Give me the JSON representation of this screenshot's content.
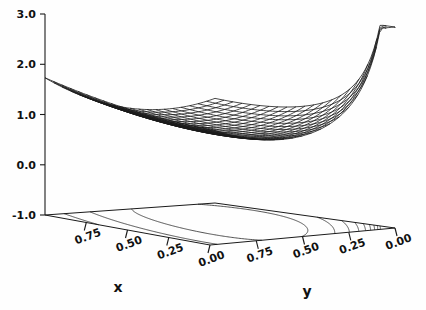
{
  "chart_data": {
    "type": "line",
    "render": "surface3d-wireframe-with-contour-base",
    "title": "",
    "xlabel": "x",
    "ylabel": "y",
    "zlabel": "",
    "grid": false,
    "legend": null,
    "xlim": [
      0.0,
      1.0
    ],
    "ylim": [
      0.0,
      1.0
    ],
    "zlim": [
      -1.0,
      3.0
    ],
    "x_tick_labels": [
      "0.75",
      "0.50",
      "0.25",
      "0.00"
    ],
    "x_tick_values": [
      0.75,
      0.5,
      0.25,
      0.0
    ],
    "y_tick_labels": [
      "0.75",
      "0.50",
      "0.25",
      "0.00"
    ],
    "y_tick_values": [
      0.75,
      0.5,
      0.25,
      0.0
    ],
    "z_tick_labels": [
      "3.0",
      "2.0",
      "1.0",
      "0.0",
      "-1.0"
    ],
    "z_tick_values": [
      3.0,
      2.0,
      1.0,
      0.0,
      -1.0
    ],
    "surface_z_max_clip": 3.0,
    "surface_z_min_observed": -0.45,
    "surface_z_at_far_left_corner": 1.5,
    "contour_base_z": -1.0,
    "contour_levels": [
      0.0,
      0.25,
      0.5,
      0.75,
      1.0,
      1.25,
      1.5,
      1.75,
      2.0,
      2.25,
      2.5,
      2.75,
      3.0
    ],
    "n_grid": 21
  },
  "axes": {
    "z_axis_name": "z-axis",
    "x_axis_name": "x-axis",
    "y_axis_name": "y-axis",
    "x_title": "x",
    "y_title": "y"
  },
  "style": {
    "line_color": "#1a1a1a",
    "background": "#ffffff",
    "axis_color": "#1a1a1a"
  }
}
